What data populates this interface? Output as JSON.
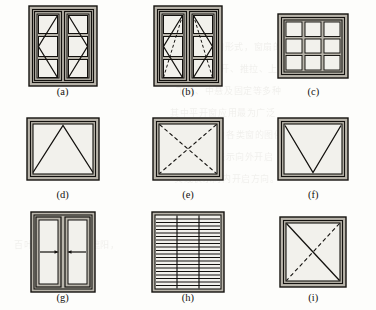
{
  "figure": {
    "kind": "technical-line-drawing",
    "columns": 3,
    "rows": 3,
    "ink_color": "#13110e",
    "frame_fill": "#b9b5ab",
    "glass_fill": "#f2f1ec",
    "paper_color": "#fdfdfb"
  },
  "panels": [
    {
      "id": "a",
      "caption": "(a)",
      "name": "double-casement-side-hung",
      "width": 68,
      "height": 78,
      "sashes": 2,
      "panes_per_sash": 3,
      "opening_symbol": "solid-chevron",
      "dashed_symbol": false,
      "arrows": 0
    },
    {
      "id": "b",
      "caption": "(b)",
      "name": "double-casement-tilt-and-turn",
      "width": 68,
      "height": 78,
      "sashes": 2,
      "panes_per_sash": 3,
      "opening_symbol": "solid-chevron",
      "dashed_symbol": true,
      "arrows": 0
    },
    {
      "id": "c",
      "caption": "(c)",
      "name": "fixed-grid-window",
      "width": 70,
      "height": 64,
      "sashes": 1,
      "grid_cols": 3,
      "grid_rows": 3,
      "opening_symbol": "none",
      "dashed_symbol": false,
      "arrows": 0
    },
    {
      "id": "d",
      "caption": "(d)",
      "name": "bottom-hung-hopper-window",
      "width": 72,
      "height": 62,
      "sashes": 1,
      "opening_symbol": "solid-triangle-apex-top",
      "dashed_symbol": false,
      "arrows": 0
    },
    {
      "id": "e",
      "caption": "(e)",
      "name": "awning-window-dashed-cross",
      "width": 70,
      "height": 62,
      "sashes": 1,
      "opening_symbol": "dashed-cross",
      "dashed_symbol": true,
      "arrows": 0
    },
    {
      "id": "f",
      "caption": "(f)",
      "name": "top-hung-window",
      "width": 70,
      "height": 62,
      "sashes": 1,
      "opening_symbol": "solid-vee-apex-bottom",
      "dashed_symbol": false,
      "arrows": 0
    },
    {
      "id": "g",
      "caption": "(g)",
      "name": "horizontal-sliding-window",
      "width": 64,
      "height": 78,
      "sashes": 2,
      "opening_symbol": "inward-arrows",
      "dashed_symbol": false,
      "arrows": 2
    },
    {
      "id": "h",
      "caption": "(h)",
      "name": "louvre-jalousie-window",
      "width": 72,
      "height": 80,
      "sashes": 1,
      "slats": 20,
      "mullions": 2,
      "opening_symbol": "horizontal-slats",
      "dashed_symbol": false,
      "arrows": 0
    },
    {
      "id": "i",
      "caption": "(i)",
      "name": "pivot-window-solid-and-dashed-diagonal",
      "width": 66,
      "height": 70,
      "sashes": 1,
      "opening_symbol": "solid-diagonal-tl-br",
      "dashed_symbol": true,
      "arrows": 0
    }
  ],
  "background_bleed_text": [
    "的结构形式，窗扇的开启",
    "方式有平开、推拉、上悬",
    "下悬、中悬及固定等多种",
    "其中平开窗应用最为广泛",
    "图中所示为各类窗的图例",
    "符号，虚线表示向外开启",
    "实线表示向内开启方向。",
    "百叶窗用于通风和遮阳，"
  ]
}
